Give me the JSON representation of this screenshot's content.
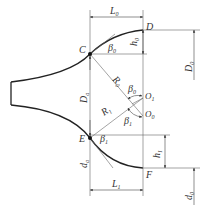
{
  "diagram": {
    "type": "nozzle-profile-geometry",
    "colors": {
      "profile": "#222222",
      "line": "#555555",
      "text": "#333333",
      "background": "#ffffff"
    },
    "points": {
      "C": {
        "label": "C",
        "x": 90,
        "y": 54
      },
      "D": {
        "label": "D",
        "x": 143,
        "y": 30
      },
      "E": {
        "label": "E",
        "x": 90,
        "y": 138
      },
      "F": {
        "label": "F",
        "x": 143,
        "y": 168
      },
      "O1": {
        "label": "O",
        "sub": "1",
        "x": 143,
        "y": 98
      },
      "O0": {
        "label": "O",
        "sub": "0",
        "x": 143,
        "y": 116
      }
    },
    "labels": {
      "L0": {
        "main": "L",
        "sub": "0"
      },
      "L1": {
        "main": "L",
        "sub": "1"
      },
      "h0": {
        "main": "h",
        "sub": "0"
      },
      "h1": {
        "main": "h",
        "sub": "1"
      },
      "R0": {
        "main": "R",
        "sub": "0"
      },
      "R1": {
        "main": "R",
        "sub": "1"
      },
      "beta0_top": {
        "main": "β",
        "sub": "0"
      },
      "beta0_center": {
        "main": "β",
        "sub": "0"
      },
      "beta1_top": {
        "main": "β",
        "sub": "1"
      },
      "beta1_bottom": {
        "main": "β",
        "sub": "1"
      },
      "Da": {
        "main": "D",
        "sub": "a"
      },
      "D0": {
        "main": "D",
        "sub": "0"
      },
      "da": {
        "main": "d",
        "sub": "a"
      },
      "d0": {
        "main": "d",
        "sub": "0"
      }
    }
  }
}
